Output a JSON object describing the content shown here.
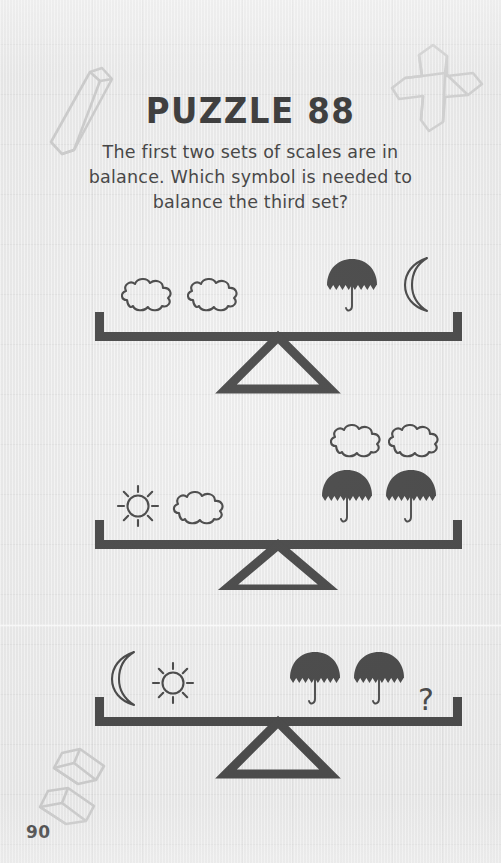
{
  "page": {
    "number": "90",
    "background_color": "#e8e8e8",
    "ink_color": "#2b2b2b",
    "decoration_color": "#c9c9c9"
  },
  "header": {
    "title": "PUZZLE 88",
    "instructions": "The first two sets of scales are in balance. Which symbol is needed to balance the third set?"
  },
  "decorations": [
    {
      "name": "bar-shape-top-left",
      "shape": "3d-bar"
    },
    {
      "name": "cross-shape-top-right",
      "shape": "3d-cross"
    },
    {
      "name": "bars-shape-bottom-left",
      "shape": "3d-double-bar"
    }
  ],
  "puzzle": {
    "type": "balance-scales",
    "symbols": [
      "cloud",
      "umbrella",
      "moon",
      "sun",
      "question"
    ],
    "scales": [
      {
        "index": 1,
        "balanced": true,
        "left": [
          "cloud",
          "cloud"
        ],
        "right": [
          "umbrella",
          "moon"
        ]
      },
      {
        "index": 2,
        "balanced": true,
        "left": [
          "sun",
          "cloud"
        ],
        "right": [
          "cloud",
          "cloud",
          "umbrella",
          "umbrella"
        ]
      },
      {
        "index": 3,
        "balanced": false,
        "left": [
          "moon",
          "sun"
        ],
        "right": [
          "umbrella",
          "umbrella",
          "question"
        ]
      }
    ]
  }
}
